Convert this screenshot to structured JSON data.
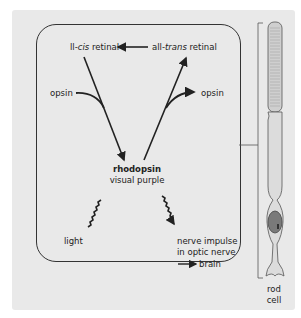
{
  "diagram": {
    "labels": {
      "cis_retinal_prefix": "ll-",
      "cis_retinal_italic": "cis",
      "cis_retinal_suffix": " retinal",
      "trans_retinal_prefix": "all-",
      "trans_retinal_italic": "trans",
      "trans_retinal_suffix": " retinal",
      "opsin_left": "opsin",
      "opsin_right": "opsin",
      "rhodopsin": "rhodopsin",
      "visual_purple": "visual purple",
      "light": "light",
      "nerve_line1": "nerve impulse",
      "nerve_line2": "in optic nerve",
      "brain": "brain",
      "rod_line1": "rod",
      "rod_line2": "cell"
    },
    "colors": {
      "background": "#e9e9e9",
      "stroke": "#222222",
      "nucleus": "#7a7a7a",
      "cell_body": "#dcdcdc"
    }
  }
}
